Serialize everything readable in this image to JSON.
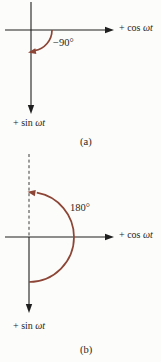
{
  "figure": {
    "colors": {
      "bg": "#fcfcfa",
      "axis": "#1f1f1f",
      "text": "#1f1f1f",
      "dash": "#3c3c3c",
      "arrow": "#8d4536"
    },
    "panel_a": {
      "caption": "(a)",
      "angle_label": "−90°",
      "cos_axis": {
        "prefix": "+ cos ",
        "variable": "ωt"
      },
      "sin_axis": {
        "prefix": "+ sin ",
        "variable": "ωt"
      }
    },
    "panel_b": {
      "caption": "(b)",
      "angle_label": "180°",
      "cos_axis": {
        "prefix": "+ cos ",
        "variable": "ωt"
      },
      "sin_axis": {
        "prefix": "+ sin ",
        "variable": "ωt"
      }
    }
  }
}
